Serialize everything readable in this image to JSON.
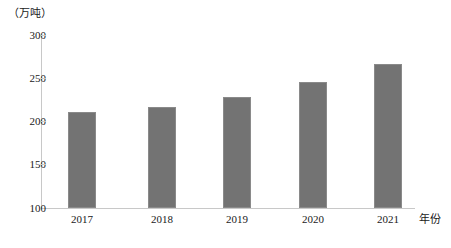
{
  "chart_data": {
    "type": "bar",
    "title": "",
    "subtitle": "",
    "unit_label": "（万吨）",
    "xlabel": "年份",
    "ylabel": "",
    "categories": [
      "2017",
      "2018",
      "2019",
      "2020",
      "2021"
    ],
    "values": [
      211,
      217,
      228,
      246,
      266
    ],
    "series": [
      {
        "name": "产量",
        "values": [
          211,
          217,
          228,
          246,
          266
        ]
      }
    ],
    "ylim": [
      100,
      300
    ],
    "yticks": [
      100,
      150,
      200,
      250,
      300
    ],
    "ytick_labels": [
      "100",
      "150",
      "200",
      "250",
      "300"
    ],
    "grid": false,
    "legend": false,
    "legend_position": "none",
    "bar_color": "#737373",
    "axis_color": "#c8c8c8",
    "text_color": "#1a1a1a",
    "background": "#ffffff"
  }
}
